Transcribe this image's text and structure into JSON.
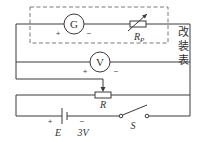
{
  "diagram": {
    "type": "circuit",
    "modified_meter_label": [
      "改",
      "装",
      "表"
    ],
    "galvanometer": {
      "symbol": "G",
      "plus": "+",
      "minus": "−"
    },
    "variable_resistor": {
      "symbol": "R",
      "subscript": "P"
    },
    "voltmeter": {
      "symbol": "V",
      "plus": "+",
      "minus": "−"
    },
    "rheostat": {
      "symbol": "R"
    },
    "battery": {
      "symbol": "E",
      "emf": "3V",
      "plus": "+",
      "minus": "−"
    },
    "switch": {
      "symbol": "S"
    },
    "colors": {
      "wire": "#3a3a3a",
      "dashed_box": "#6a6a6a",
      "background": "#ffffff"
    }
  }
}
